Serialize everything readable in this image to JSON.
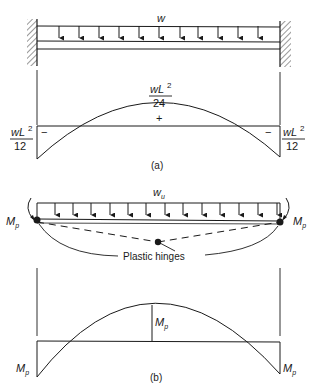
{
  "figure": {
    "part_a": {
      "load_label": "w",
      "arrow_count": 11,
      "midspan_moment": {
        "numerator": "wL",
        "exp": "2",
        "denominator": "24",
        "sign": "+"
      },
      "left_end_moment": {
        "numerator": "wL",
        "exp": "2",
        "denominator": "12",
        "sign": "−"
      },
      "right_end_moment": {
        "numerator": "wL",
        "exp": "2",
        "denominator": "12",
        "sign": "−"
      },
      "caption": "(a)"
    },
    "part_b": {
      "load_label": "w",
      "load_subscript": "u",
      "arrow_count": 13,
      "left_moment_label": "M",
      "right_moment_label": "M",
      "moment_subscript": "p",
      "hinges_label": "Plastic hinges",
      "midspan_moment_label": "M",
      "left_end_moment_label": "M",
      "right_end_moment_label": "M",
      "caption": "(b)"
    }
  }
}
